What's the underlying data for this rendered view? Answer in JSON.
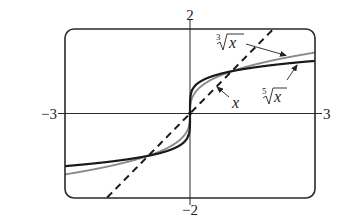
{
  "chart_data": {
    "type": "line",
    "title": "",
    "xlabel": "",
    "ylabel": "",
    "xlim": [
      -3,
      3
    ],
    "ylim": [
      -2,
      2
    ],
    "grid": false,
    "legend": "inline annotations with arrows",
    "tick_labels": {
      "x_min": "−3",
      "x_max": "3",
      "y_min": "−2",
      "y_max": "2"
    },
    "series": [
      {
        "name": "x",
        "label": "x",
        "function": "y = x",
        "style": "dashed",
        "color": "#1a1a1a",
        "x": [
          -2,
          -1,
          0,
          1,
          2
        ],
        "values": [
          -2,
          -1,
          0,
          1,
          2
        ]
      },
      {
        "name": "cube-root",
        "label_index": "3",
        "label_radicand": "x",
        "function": "y = x^(1/3)",
        "style": "solid",
        "color": "#8a8a8a",
        "x": [
          -3,
          -2,
          -1,
          -0.5,
          0,
          0.5,
          1,
          2,
          3
        ],
        "values": [
          -1.442,
          -1.26,
          -1,
          -0.794,
          0,
          0.794,
          1,
          1.26,
          1.442
        ]
      },
      {
        "name": "fifth-root",
        "label_index": "5",
        "label_radicand": "x",
        "function": "y = x^(1/5)",
        "style": "solid",
        "color": "#1a1a1a",
        "x": [
          -3,
          -2,
          -1,
          -0.5,
          0,
          0.5,
          1,
          2,
          3
        ],
        "values": [
          -1.246,
          -1.149,
          -1,
          -0.871,
          0,
          0.871,
          1,
          1.149,
          1.246
        ]
      }
    ],
    "annotations": [
      {
        "text": "∛x",
        "points_to": "cube-root"
      },
      {
        "text": "⁵√x",
        "points_to": "fifth-root"
      },
      {
        "text": "x",
        "points_to": "x"
      }
    ]
  },
  "labels": {
    "y_max": "2",
    "y_min": "−2",
    "x_min": "−3",
    "x_max": "3",
    "cube_index": "3",
    "fifth_index": "5",
    "radicand": "x",
    "line_label": "x"
  },
  "colors": {
    "frame": "#2a2a2a",
    "axis": "#2a2a2a",
    "line_dashed": "#1a1a1a",
    "cube_root": "#8a8a8a",
    "fifth_root": "#1a1a1a"
  }
}
